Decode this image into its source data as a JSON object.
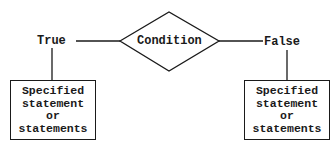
{
  "diagram": {
    "type": "if-then-else flowchart",
    "decision": {
      "label": "Condition"
    },
    "branches": {
      "true": {
        "label": "True",
        "box_lines": [
          "Specified",
          "statement",
          "or",
          "statements"
        ]
      },
      "false": {
        "label": "False",
        "box_lines": [
          "Specified",
          "statement",
          "or",
          "statements"
        ]
      }
    },
    "colors": {
      "stroke": "#1a1a1a",
      "background": "#ffffff"
    }
  }
}
